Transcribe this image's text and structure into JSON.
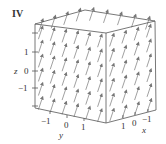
{
  "chart_data": {
    "type": "vector_field_3d",
    "title": "IV",
    "panel_label": "IV",
    "axes": {
      "x": {
        "label": "x",
        "ticks": [
          "1",
          "0",
          "−1"
        ],
        "range": [
          -1.5,
          1.5
        ]
      },
      "y": {
        "label": "y",
        "ticks": [
          "−1",
          "0",
          "1"
        ],
        "range": [
          -1.5,
          1.5
        ]
      },
      "z": {
        "label": "z",
        "ticks": [
          "1",
          "0",
          "−1"
        ],
        "range": [
          -2,
          2
        ]
      }
    },
    "field_description": "Uniform (constant) vector field; all arrows parallel, pointing mostly upward in +z with a slight tilt, drawn inside a bounding box",
    "arrow_color": "#888888",
    "box_color": "#555555",
    "grid": false,
    "legend": null
  },
  "labels": {
    "panel": "IV",
    "z_axis": "z",
    "y_axis": "y",
    "x_axis": "x",
    "z_ticks": [
      "1",
      "0",
      "−1"
    ],
    "y_ticks": [
      "−1",
      "0",
      "1"
    ],
    "x_ticks": [
      "1",
      "0",
      "−1"
    ]
  }
}
